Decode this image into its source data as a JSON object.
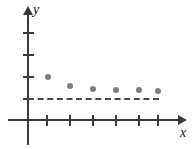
{
  "chart_data": {
    "type": "scatter",
    "title": "",
    "subtitle": "",
    "xlabel": "x",
    "ylabel": "y",
    "xlim": [
      0,
      7
    ],
    "ylim": [
      0,
      5
    ],
    "grid": false,
    "legend": null,
    "x": [
      1,
      2,
      3,
      4,
      5,
      6
    ],
    "values": [
      2.0,
      1.55,
      1.4,
      1.35,
      1.33,
      1.3
    ],
    "series": [
      {
        "name": "sequence",
        "x": [
          1,
          2,
          3,
          4,
          5,
          6
        ],
        "values": [
          2.0,
          1.55,
          1.4,
          1.35,
          1.33,
          1.3
        ]
      }
    ],
    "x_tick_labels": [
      "",
      "",
      "",
      "",
      "",
      ""
    ],
    "y_tick_labels": [
      "",
      "",
      "",
      ""
    ],
    "x_ticks": [
      1,
      2,
      3,
      4,
      5,
      6
    ],
    "y_ticks": [
      1,
      2,
      3,
      4
    ],
    "annotations": [
      {
        "type": "horizontal-dashed-asymptote",
        "y": 1,
        "x_start": 0,
        "x_end": 6,
        "label": ""
      }
    ],
    "colors": {
      "point": "#7e7e7e",
      "axis": "#3a3a3a",
      "asymptote": "#4a4a4a",
      "background": "#ffffff",
      "label": "#111111"
    }
  },
  "figure": {
    "axis_label_y": "y",
    "axis_label_x": "x"
  },
  "geometry": {
    "origin": {
      "x": 28,
      "y": 120
    },
    "x_tick_px": [
      47,
      70,
      93,
      116,
      139,
      158
    ],
    "y_tick_px": [
      33,
      55,
      77,
      99
    ],
    "point_px": [
      {
        "x": 48,
        "y": 77
      },
      {
        "x": 70,
        "y": 86
      },
      {
        "x": 93,
        "y": 89
      },
      {
        "x": 116,
        "y": 90
      },
      {
        "x": 139,
        "y": 90
      },
      {
        "x": 158,
        "y": 91
      }
    ],
    "asymptote_px": {
      "y": 99,
      "x_start": 28,
      "x_end": 159
    }
  }
}
